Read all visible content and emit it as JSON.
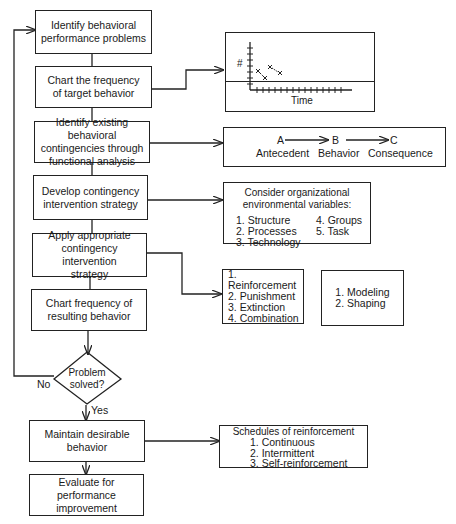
{
  "flow": {
    "steps": [
      {
        "id": "s1",
        "lines": [
          "Identify behavioral",
          "performance problems"
        ]
      },
      {
        "id": "s2",
        "lines": [
          "Chart the frequency",
          "of target behavior"
        ]
      },
      {
        "id": "s3",
        "lines": [
          "Identify existing behavioral",
          "contingencies through",
          "functional analysis"
        ]
      },
      {
        "id": "s4",
        "lines": [
          "Develop contingency",
          "intervention strategy"
        ]
      },
      {
        "id": "s5",
        "lines": [
          "Apply appropriate",
          "contingency intervention",
          "strategy"
        ]
      },
      {
        "id": "s6",
        "lines": [
          "Chart frequency of",
          "resulting behavior"
        ]
      },
      {
        "id": "s7",
        "lines": [
          "Maintain desirable",
          "behavior"
        ]
      },
      {
        "id": "s8",
        "lines": [
          "Evaluate for",
          "performance improvement"
        ]
      }
    ],
    "decision": {
      "lines": [
        "Problem",
        "solved?"
      ],
      "no_label": "No",
      "yes_label": "Yes"
    }
  },
  "side": {
    "chart": {
      "ylabel": "#",
      "xlabel": "Time"
    },
    "abc": {
      "letters": [
        "A",
        "B",
        "C"
      ],
      "labels": [
        "Antecedent",
        "Behavior",
        "Consequence"
      ]
    },
    "variables": {
      "title_lines": [
        "Consider organizational",
        "environmental variables:"
      ],
      "col1": [
        "1.  Structure",
        "2.  Processes",
        "3.  Technology"
      ],
      "col2": [
        "4.  Groups",
        "5.  Task"
      ]
    },
    "strategies": [
      "1.  Reinforcement",
      "2.  Punishment",
      "3.  Extinction",
      "4.  Combination"
    ],
    "techniques": [
      "1.  Modeling",
      "2.  Shaping"
    ],
    "schedules": {
      "title": "Schedules of reinforcement",
      "items": [
        "1.  Continuous",
        "2.  Intermittent",
        "3.  Self-reinforcement"
      ]
    }
  }
}
